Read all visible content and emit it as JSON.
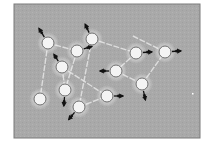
{
  "diagram": {
    "type": "node-link graph",
    "frame": {
      "x": 14,
      "y": 4,
      "width": 186,
      "height": 134,
      "fill": "#a9a9a9",
      "stroke": "#7a7a7a"
    },
    "colors": {
      "background": "#ffffff",
      "panel": "#a9a9a9",
      "edge": "#e6e6e6",
      "node_fill": "#f4f4f4",
      "node_stroke": "#6e6e6e",
      "arrow": "#111111",
      "glow": "#ffffff"
    },
    "nodes": [
      {
        "id": "A",
        "x": 48,
        "y": 43,
        "arrow": {
          "dx": -8,
          "dy": -13
        }
      },
      {
        "id": "B",
        "x": 92,
        "y": 39,
        "arrow": {
          "dx": -6,
          "dy": -13
        }
      },
      {
        "id": "C",
        "x": 77,
        "y": 51,
        "arrow": {
          "dx": 13,
          "dy": -4
        }
      },
      {
        "id": "D",
        "x": 62,
        "y": 67,
        "arrow": {
          "dx": -7,
          "dy": -11
        }
      },
      {
        "id": "E",
        "x": 65,
        "y": 90,
        "arrow": {
          "dx": -1,
          "dy": 14
        }
      },
      {
        "id": "F",
        "x": 40,
        "y": 99,
        "arrow": null
      },
      {
        "id": "G",
        "x": 79,
        "y": 107,
        "arrow": {
          "dx": -9,
          "dy": 11
        }
      },
      {
        "id": "H",
        "x": 107,
        "y": 96,
        "arrow": {
          "dx": 14,
          "dy": 0
        }
      },
      {
        "id": "I",
        "x": 116,
        "y": 71,
        "arrow": {
          "dx": -14,
          "dy": 0
        }
      },
      {
        "id": "J",
        "x": 136,
        "y": 53,
        "arrow": {
          "dx": 14,
          "dy": -1
        }
      },
      {
        "id": "K",
        "x": 165,
        "y": 52,
        "arrow": {
          "dx": 14,
          "dy": -1
        }
      },
      {
        "id": "L",
        "x": 142,
        "y": 84,
        "arrow": {
          "dx": 3,
          "dy": 14
        }
      }
    ],
    "edges": [
      {
        "from": "A",
        "to": "C"
      },
      {
        "from": "A",
        "to": "F"
      },
      {
        "from": "C",
        "to": "E"
      },
      {
        "from": "D",
        "to": "E"
      },
      {
        "from": "D",
        "to": "H"
      },
      {
        "from": "B",
        "to": "G"
      },
      {
        "from": "G",
        "to": "H"
      },
      {
        "from": "B",
        "to": "J"
      },
      {
        "from": "J",
        "to": "I"
      },
      {
        "from": "I",
        "to": "L"
      },
      {
        "from": "L",
        "to": "K"
      },
      {
        "from": "K",
        "to": "K_tail"
      }
    ],
    "free_points": [
      {
        "id": "K_tail",
        "x": 133,
        "y": 36
      },
      {
        "id": "speck",
        "x": 192,
        "y": 93
      }
    ],
    "node_radius": 6
  }
}
